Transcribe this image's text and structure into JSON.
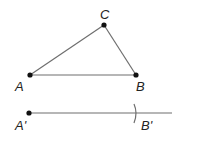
{
  "diagram": {
    "colors": {
      "line": "#6e6e6e",
      "point": "#111111",
      "label": "#222222"
    },
    "points": [
      {
        "id": "A",
        "label": "A",
        "x": 30,
        "y": 75
      },
      {
        "id": "B",
        "label": "B",
        "x": 136,
        "y": 75
      },
      {
        "id": "C",
        "label": "C",
        "x": 104,
        "y": 25
      },
      {
        "id": "A_prime",
        "label": "A'",
        "x": 29,
        "y": 113
      },
      {
        "id": "B_prime",
        "label": "B'",
        "x": 135,
        "y": 113
      }
    ],
    "segments": [
      {
        "from": "A",
        "to": "B"
      },
      {
        "from": "B",
        "to": "C"
      },
      {
        "from": "C",
        "to": "A"
      },
      {
        "from": "A_prime",
        "to": "ray_end",
        "note": "ray from A' extending right"
      }
    ],
    "arc": {
      "center": "A_prime",
      "note": "compass arc marking B' at distance AB"
    }
  }
}
